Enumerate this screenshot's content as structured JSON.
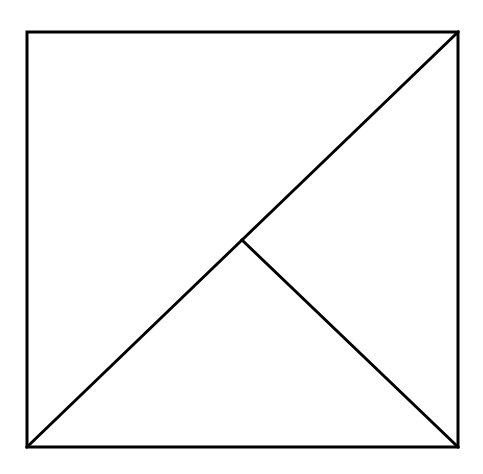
{
  "diagram": {
    "type": "geometric-figure",
    "stroke_color": "#000000",
    "stroke_width": 3,
    "background": "#ffffff",
    "points": {
      "top_left": [
        27,
        32
      ],
      "top_right": [
        458,
        32
      ],
      "bottom_left": [
        27,
        447
      ],
      "bottom_right": [
        458,
        447
      ],
      "center": [
        242,
        240
      ]
    },
    "segments": [
      {
        "name": "square-outline",
        "from": "top_left",
        "to": "top_left"
      },
      {
        "name": "diagonal",
        "from": "bottom_left",
        "to": "top_right"
      },
      {
        "name": "inner-segment",
        "from": "center",
        "to": "bottom_right"
      }
    ]
  }
}
